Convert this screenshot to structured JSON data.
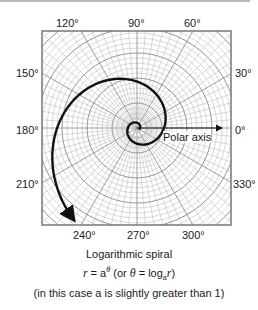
{
  "figure": {
    "angle_labels": {
      "a120": "120°",
      "a90": "90°",
      "a60": "60°",
      "a150": "150°",
      "a30": "30°",
      "a180": "180°",
      "a0": "0°",
      "a210": "210°",
      "a330": "330°",
      "a240": "240°",
      "a270": "270°",
      "a300": "300°"
    },
    "polar_axis_label": "Polar axis",
    "title": "Logarithmic spiral",
    "formula": {
      "r": "r",
      "eq1": " = a",
      "exp": "θ",
      "mid": " (or ",
      "theta": "θ",
      "eq2": " = log",
      "sub": "a",
      "r2": "r",
      "close": ")"
    },
    "note": "(in this case a is slightly greater than 1)",
    "colors": {
      "spiral": "#111111",
      "grid": "#9a9a9a",
      "frame": "#777777"
    }
  }
}
